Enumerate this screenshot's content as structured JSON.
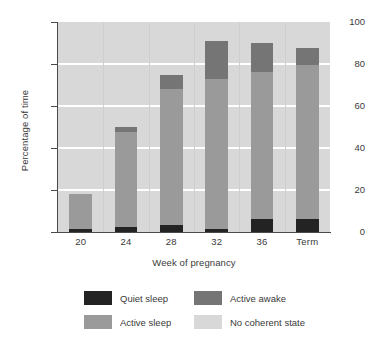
{
  "chart_data": {
    "type": "bar",
    "subtype": "stacked-bar",
    "title": "",
    "xlabel": "Week of pregnancy",
    "ylabel": "Percentage of time",
    "categories": [
      "20",
      "24",
      "28",
      "32",
      "36",
      "Term"
    ],
    "ylim": [
      0,
      100
    ],
    "yticks": [
      0,
      20,
      40,
      60,
      80,
      100
    ],
    "grid": "horizontal-white",
    "legend_position": "below",
    "stack_order_bottom_to_top": [
      "Quiet sleep",
      "Active sleep",
      "Active awake",
      "No coherent state"
    ],
    "series": [
      {
        "name": "Quiet sleep",
        "color": "#232323",
        "values": [
          1.5,
          2.5,
          3.5,
          1.5,
          6,
          6
        ]
      },
      {
        "name": "Active sleep",
        "color": "#9a9a9a",
        "values": [
          16.5,
          45,
          64.5,
          71.5,
          70,
          73.5
        ]
      },
      {
        "name": "Active awake",
        "color": "#757575",
        "values": [
          0,
          2.5,
          7,
          18,
          14,
          8
        ]
      },
      {
        "name": "No coherent state",
        "color": "#d8d8d8",
        "values": [
          82,
          50,
          25,
          9,
          10,
          12.5
        ]
      }
    ],
    "bar_totals_excluding_no_coherent_state": [
      18,
      50,
      75,
      91,
      90,
      87.5
    ]
  },
  "axes": {
    "y_tick_labels": [
      "0",
      "20",
      "40",
      "60",
      "80",
      "100"
    ],
    "x_tick_labels": [
      "20",
      "24",
      "28",
      "32",
      "36",
      "Term"
    ],
    "y_axis_title": "Percentage of time",
    "x_axis_title": "Week of pregnancy"
  },
  "legend": {
    "items": [
      {
        "label": "Quiet sleep",
        "color": "#232323"
      },
      {
        "label": "Active awake",
        "color": "#757575"
      },
      {
        "label": "Active sleep",
        "color": "#9a9a9a"
      },
      {
        "label": "No coherent state",
        "color": "#d8d8d8"
      }
    ]
  },
  "colors": {
    "background": "#ffffff",
    "plot_background": "#d8d8d8",
    "gridline": "#ffffff",
    "axis": "#4a4a4a",
    "text": "#3a3a3a"
  }
}
